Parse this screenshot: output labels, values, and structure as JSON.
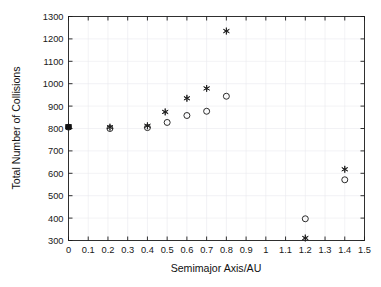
{
  "figure": {
    "width": 381,
    "height": 287,
    "background": "#ffffff"
  },
  "chart_data": {
    "type": "scatter",
    "title": "",
    "xlabel": "Semimajor Axis/AU",
    "ylabel": "Total Number of Collisions",
    "xlim": [
      0,
      1.5
    ],
    "ylim": [
      300,
      1300
    ],
    "xticks": [
      0,
      0.1,
      0.2,
      0.3,
      0.4,
      0.5,
      0.6,
      0.7,
      0.8,
      0.9,
      1,
      1.1,
      1.2,
      1.3,
      1.4,
      1.5
    ],
    "xtick_labels": [
      "0",
      "0.1",
      "0.2",
      "0.3",
      "0.4",
      "0.5",
      "0.6",
      "0.7",
      "0.8",
      "0.9",
      "1",
      "1.1",
      "1.2",
      "1.3",
      "1.4",
      "1.5"
    ],
    "yticks": [
      300,
      400,
      500,
      600,
      700,
      800,
      900,
      1000,
      1100,
      1200,
      1300
    ],
    "ytick_labels": [
      "300",
      "400",
      "500",
      "600",
      "700",
      "800",
      "900",
      "1000",
      "1100",
      "1200",
      "1300"
    ],
    "grid": true,
    "legend": null,
    "marker_color": "#202020",
    "series": [
      {
        "name": "asterisk",
        "marker": "star",
        "points": [
          {
            "x": 0.0,
            "y": 808
          },
          {
            "x": 0.21,
            "y": 806
          },
          {
            "x": 0.4,
            "y": 812
          },
          {
            "x": 0.49,
            "y": 874
          },
          {
            "x": 0.6,
            "y": 935
          },
          {
            "x": 0.7,
            "y": 979
          },
          {
            "x": 0.8,
            "y": 1235
          },
          {
            "x": 1.2,
            "y": 311
          },
          {
            "x": 1.4,
            "y": 618
          }
        ]
      },
      {
        "name": "circle",
        "marker": "circle",
        "points": [
          {
            "x": 0.0,
            "y": 806
          },
          {
            "x": 0.21,
            "y": 800
          },
          {
            "x": 0.4,
            "y": 804
          },
          {
            "x": 0.5,
            "y": 827
          },
          {
            "x": 0.6,
            "y": 858
          },
          {
            "x": 0.7,
            "y": 877
          },
          {
            "x": 0.8,
            "y": 944
          },
          {
            "x": 1.2,
            "y": 397
          },
          {
            "x": 1.4,
            "y": 571
          }
        ]
      }
    ]
  }
}
